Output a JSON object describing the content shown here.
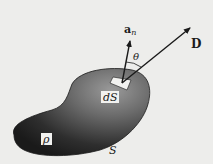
{
  "diagram": {
    "labels": {
      "normal": "a",
      "normal_sub": "n",
      "field": "D",
      "angle": "θ",
      "patch": "dS",
      "charge": "ρ",
      "surface": "S"
    },
    "colors": {
      "background": "#ededeb",
      "shape_dark": "#1e1e1e",
      "shape_light": "#8a8a8a",
      "ink": "#1a1a1a"
    }
  }
}
